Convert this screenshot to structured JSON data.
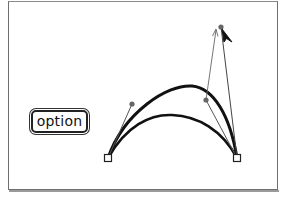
{
  "figure": {
    "modifier_key": {
      "label": "option"
    },
    "colors": {
      "curve": "#111111",
      "handle_line": "#555555",
      "handle_point": "#666666",
      "anchor_fill": "#ffffff",
      "anchor_stroke": "#222222",
      "frame": "#6f6f6f",
      "cursor": "#111111"
    },
    "anchors": [
      {
        "name": "left-anchor",
        "x": 108,
        "y": 158
      },
      {
        "name": "right-anchor",
        "x": 237,
        "y": 158
      }
    ],
    "handles": [
      {
        "name": "left-handle",
        "x": 132,
        "y": 104
      },
      {
        "name": "right-handle-original",
        "x": 206,
        "y": 100
      },
      {
        "name": "right-handle-dragged",
        "x": 221,
        "y": 27
      }
    ],
    "curves": [
      {
        "name": "original-curve",
        "path": "M108,158 C128,108 210,80 237,158"
      },
      {
        "name": "adjusted-curve",
        "path": "M108,158 C130,100 220,30 237,158"
      }
    ],
    "cursor": {
      "icon": "arrow-pointer-icon",
      "x": 221,
      "y": 27
    },
    "caption_partial": ""
  }
}
